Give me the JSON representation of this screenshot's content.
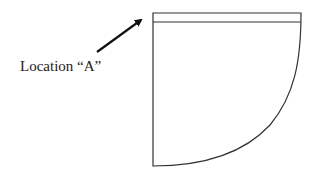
{
  "diagram": {
    "label": "Location “A”",
    "colors": {
      "stroke": "#333333",
      "arrow": "#111111",
      "text": "#1a1a1a",
      "background": "#ffffff"
    },
    "shape": {
      "description": "Quarter-circle sector with a thin strip along the top edge",
      "top_strip": "narrow band at top of the shape"
    },
    "arrow": {
      "points_to": "top-left corner of the top strip"
    }
  }
}
